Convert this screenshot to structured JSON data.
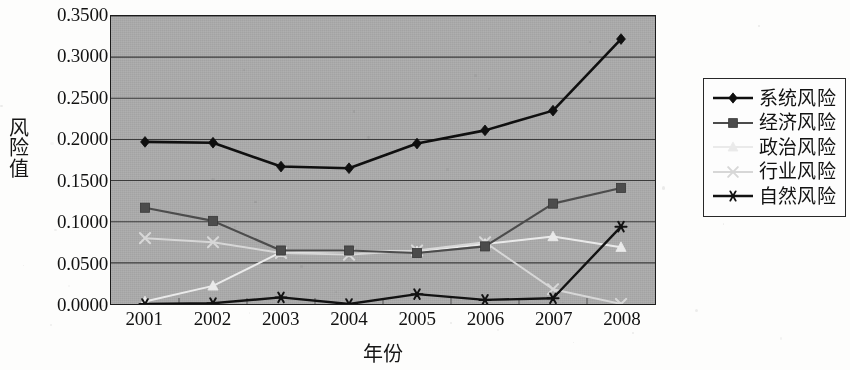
{
  "figure": {
    "y_axis_title": "风险值",
    "x_axis_title": "年份"
  },
  "axis": {
    "y_ticks": [
      "0.0000",
      "0.0500",
      "0.1000",
      "0.1500",
      "0.2000",
      "0.2500",
      "0.3000",
      "0.3500"
    ],
    "x_ticks": [
      "2001",
      "2002",
      "2003",
      "2004",
      "2005",
      "2006",
      "2007",
      "2008"
    ]
  },
  "legend": {
    "items": [
      {
        "label": "系统风险",
        "marker": "diamond",
        "color": "#111111"
      },
      {
        "label": "经济风险",
        "marker": "square",
        "color": "#4d4d4d"
      },
      {
        "label": "政治风险",
        "marker": "triangle",
        "color": "#e8e8e8"
      },
      {
        "label": "行业风险",
        "marker": "x",
        "color": "#d5d5d5"
      },
      {
        "label": "自然风险",
        "marker": "asterisk",
        "color": "#141414"
      }
    ]
  },
  "chart_data": {
    "type": "line",
    "title": "",
    "xlabel": "年份",
    "ylabel": "风险值",
    "categories": [
      "2001",
      "2002",
      "2003",
      "2004",
      "2005",
      "2006",
      "2007",
      "2008"
    ],
    "ylim": [
      0.0,
      0.35
    ],
    "ytick_step": 0.05,
    "grid": true,
    "legend_position": "right",
    "plot_background": "#a9a9a9",
    "series": [
      {
        "name": "系统风险",
        "marker": "diamond",
        "color": "#111111",
        "values": [
          0.197,
          0.196,
          0.167,
          0.165,
          0.195,
          0.211,
          0.235,
          0.322
        ]
      },
      {
        "name": "经济风险",
        "marker": "square",
        "color": "#4d4d4d",
        "values": [
          0.117,
          0.101,
          0.065,
          0.065,
          0.062,
          0.07,
          0.122,
          0.141
        ]
      },
      {
        "name": "政治风险",
        "marker": "triangle",
        "color": "#e8e8e8",
        "values": [
          0.003,
          0.022,
          0.063,
          0.064,
          0.064,
          0.073,
          0.082,
          0.069
        ]
      },
      {
        "name": "行业风险",
        "marker": "x",
        "color": "#d5d5d5",
        "values": [
          0.08,
          0.075,
          0.062,
          0.06,
          0.065,
          0.075,
          0.018,
          0.0
        ]
      },
      {
        "name": "自然风险",
        "marker": "asterisk",
        "color": "#141414",
        "values": [
          0.0,
          0.001,
          0.008,
          0.0,
          0.012,
          0.005,
          0.007,
          0.094
        ]
      }
    ]
  }
}
